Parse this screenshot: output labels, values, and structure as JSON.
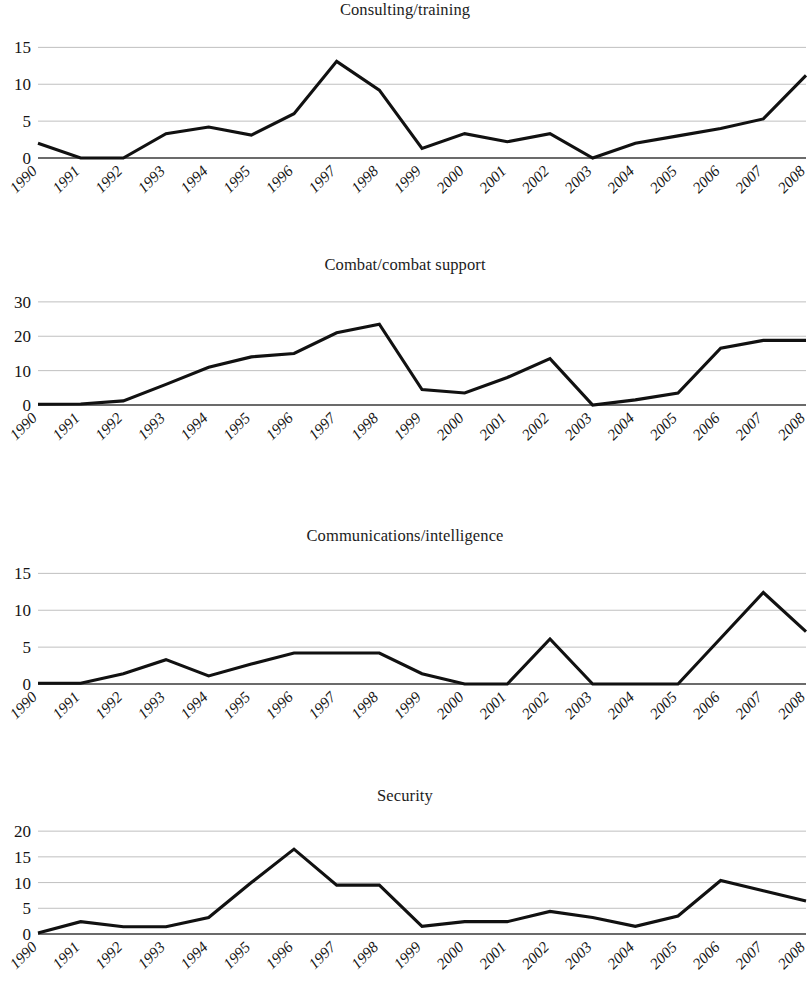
{
  "page": {
    "background": "#ffffff",
    "line_color": "#111111",
    "grid_color": "#b9b9b9",
    "axis_color": "#3a3a3a",
    "text_color": "#151515"
  },
  "shared": {
    "categories": [
      "1990",
      "1991",
      "1992",
      "1993",
      "1994",
      "1995",
      "1996",
      "1997",
      "1998",
      "1999",
      "2000",
      "2001",
      "2002",
      "2003",
      "2004",
      "2005",
      "2006",
      "2007",
      "2008"
    ],
    "xlabel": "",
    "grid": true,
    "legend": "none"
  },
  "chart_data": [
    {
      "type": "line",
      "title": "Consulting/training",
      "xlabel": "",
      "ylabel": "",
      "ylim": [
        0,
        16
      ],
      "yticks": [
        0,
        5,
        10,
        15
      ],
      "ytick_labels": [
        "0",
        "5",
        "10",
        "15"
      ],
      "categories": [
        "1990",
        "1991",
        "1992",
        "1993",
        "1994",
        "1995",
        "1996",
        "1997",
        "1998",
        "1999",
        "2000",
        "2001",
        "2002",
        "2003",
        "2004",
        "2005",
        "2006",
        "2007",
        "2008"
      ],
      "values": [
        2,
        0,
        0,
        3.3,
        4.2,
        3.1,
        6,
        13.1,
        9.2,
        1.3,
        3.3,
        2.2,
        3.3,
        0,
        2,
        3,
        4,
        5.3,
        11.2
      ],
      "grid": true,
      "legend": "none"
    },
    {
      "type": "line",
      "title": "Combat/combat support",
      "xlabel": "",
      "ylabel": "",
      "ylim": [
        0,
        32
      ],
      "yticks": [
        0,
        10,
        20,
        30
      ],
      "ytick_labels": [
        "0",
        "10",
        "20",
        "30"
      ],
      "categories": [
        "1990",
        "1991",
        "1992",
        "1993",
        "1994",
        "1995",
        "1996",
        "1997",
        "1998",
        "1999",
        "2000",
        "2001",
        "2002",
        "2003",
        "2004",
        "2005",
        "2006",
        "2007",
        "2008"
      ],
      "values": [
        0.2,
        0.3,
        1.2,
        6,
        11,
        14,
        15,
        21,
        23.5,
        4.5,
        3.5,
        8,
        13.5,
        0,
        1.5,
        3.5,
        16.5,
        18.8,
        18.8
      ],
      "grid": true,
      "legend": "none"
    },
    {
      "type": "line",
      "title": "Communications/intelligence",
      "xlabel": "",
      "ylabel": "",
      "ylim": [
        0,
        16
      ],
      "yticks": [
        0,
        5,
        10,
        15
      ],
      "ytick_labels": [
        "0",
        "5",
        "10",
        "15"
      ],
      "categories": [
        "1990",
        "1991",
        "1992",
        "1993",
        "1994",
        "1995",
        "1996",
        "1997",
        "1998",
        "1999",
        "2000",
        "2001",
        "2002",
        "2003",
        "2004",
        "2005",
        "2006",
        "2007",
        "2008"
      ],
      "values": [
        0.1,
        0.1,
        1.4,
        3.3,
        1.1,
        2.7,
        4.2,
        4.2,
        4.2,
        1.4,
        0,
        0,
        6.1,
        0,
        0,
        0,
        6.2,
        12.4,
        7.1
      ],
      "grid": true,
      "legend": "none"
    },
    {
      "type": "line",
      "title": "Security",
      "xlabel": "",
      "ylabel": "",
      "ylim": [
        0,
        21
      ],
      "yticks": [
        0,
        5,
        10,
        15,
        20
      ],
      "ytick_labels": [
        "0",
        "5",
        "10",
        "15",
        "20"
      ],
      "categories": [
        "1990",
        "1991",
        "1992",
        "1993",
        "1994",
        "1995",
        "1996",
        "1997",
        "1998",
        "1999",
        "2000",
        "2001",
        "2002",
        "2003",
        "2004",
        "2005",
        "2006",
        "2007",
        "2008"
      ],
      "values": [
        0.2,
        2.4,
        1.4,
        1.4,
        3.2,
        10,
        16.5,
        9.5,
        9.5,
        1.5,
        2.4,
        2.4,
        4.4,
        3.2,
        1.5,
        3.5,
        10.4,
        8.4,
        6.4
      ],
      "grid": true,
      "legend": "none"
    }
  ]
}
